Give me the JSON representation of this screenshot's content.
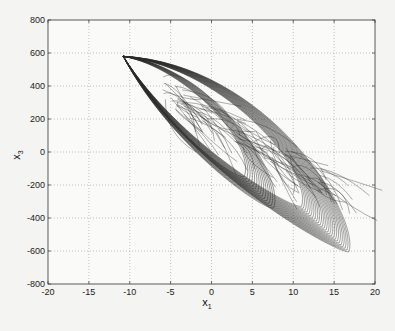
{
  "chart_data": {
    "type": "line",
    "title": "",
    "xlabel": "x",
    "xlabel_sub": "1",
    "ylabel": "x",
    "ylabel_sub": "3",
    "xlim": [
      -20,
      20
    ],
    "ylim": [
      -800,
      800
    ],
    "xticks": [
      -20,
      -15,
      -10,
      -5,
      0,
      5,
      10,
      15,
      20
    ],
    "yticks": [
      -800,
      -600,
      -400,
      -200,
      0,
      200,
      400,
      600,
      800
    ],
    "xtick_labels": [
      "-20",
      "-15",
      "-10",
      "-5",
      "0",
      "5",
      "10",
      "15",
      "20"
    ],
    "ytick_labels": [
      "-800",
      "-600",
      "-400",
      "-200",
      "0",
      "200",
      "400",
      "600",
      "800"
    ],
    "grid": true,
    "grid_style": "dotted",
    "legend": null,
    "line_color": "#2a2a2a",
    "series": [
      {
        "name": "trajectory",
        "key_points": [
          {
            "x": -10.8,
            "y": 580
          },
          {
            "x": -5,
            "y": 480
          },
          {
            "x": 0,
            "y": 380
          },
          {
            "x": 5,
            "y": 260
          },
          {
            "x": 10,
            "y": 80
          },
          {
            "x": 14,
            "y": -150
          },
          {
            "x": 16.5,
            "y": -450
          },
          {
            "x": 16.5,
            "y": -600
          },
          {
            "x": 14,
            "y": -560
          },
          {
            "x": 10,
            "y": -340
          },
          {
            "x": 7.5,
            "y": -330
          },
          {
            "x": 5,
            "y": -200
          },
          {
            "x": 0,
            "y": 40
          },
          {
            "x": -5,
            "y": 300
          },
          {
            "x": -10.8,
            "y": 580
          }
        ]
      }
    ]
  }
}
